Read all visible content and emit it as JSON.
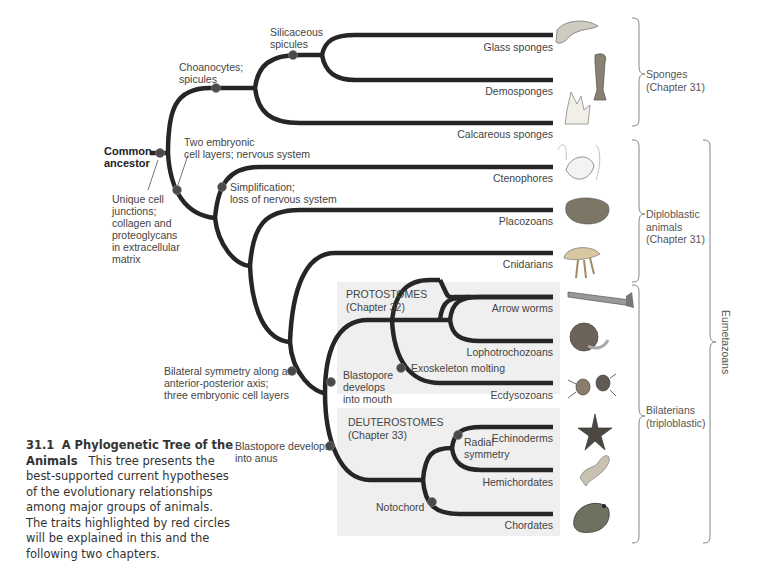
{
  "root": {
    "label_line1": "Common",
    "label_line2": "ancestor"
  },
  "traits": {
    "unique_junctions": [
      "Unique cell",
      "junctions;",
      "collagen and",
      "proteoglycans",
      "in extracellular",
      "matrix"
    ],
    "choanocytes": [
      "Choanocytes;",
      "spicules"
    ],
    "silicaceous": [
      "Silicaceous",
      "spicules"
    ],
    "two_layers": [
      "Two embryonic",
      "cell layers; nervous system"
    ],
    "simplification": [
      "Simplification;",
      "loss of nervous system"
    ],
    "bilateral": [
      "Bilateral symmetry along an",
      "anterior-posterior axis;",
      "three embryonic cell layers"
    ],
    "blastopore_mouth": [
      "Blastopore",
      "develops",
      "into mouth"
    ],
    "exoskeleton": "Exoskeleton molting",
    "blastopore_anus": [
      "Blastopore develops",
      "into anus"
    ],
    "radial": [
      "Radial",
      "symmetry"
    ],
    "notochord": "Notochord"
  },
  "taxa": [
    {
      "name": "Glass sponges",
      "icon": "glass-sponge-illustration"
    },
    {
      "name": "Demosponges",
      "icon": "demosponge-illustration"
    },
    {
      "name": "Calcareous sponges",
      "icon": "calcareous-sponge-illustration"
    },
    {
      "name": "Ctenophores",
      "icon": "ctenophore-illustration"
    },
    {
      "name": "Placozoans",
      "icon": "placozoan-illustration"
    },
    {
      "name": "Cnidarians",
      "icon": "jellyfish-illustration"
    },
    {
      "name": "Arrow worms",
      "icon": "arrow-worm-illustration"
    },
    {
      "name": "Lophotrochozoans",
      "icon": "nautilus-illustration"
    },
    {
      "name": "Ecdysozoans",
      "icon": "mite-illustration"
    },
    {
      "name": "Echinoderms",
      "icon": "sea-star-illustration"
    },
    {
      "name": "Hemichordates",
      "icon": "acorn-worm-illustration"
    },
    {
      "name": "Chordates",
      "icon": "frog-illustration"
    }
  ],
  "panels": {
    "protostomes": {
      "title": "PROTOSTOMES",
      "chapter": "(Chapter 32)"
    },
    "deuterostomes": {
      "title": "DEUTEROSTOMES",
      "chapter": "(Chapter 33)"
    }
  },
  "groups": {
    "sponges": [
      "Sponges",
      "(Chapter 31)"
    ],
    "diploblastic": [
      "Diploblastic",
      "animals",
      "(Chapter 31)"
    ],
    "bilaterians": [
      "Bilaterians",
      "(triploblastic)"
    ],
    "eumetazoans": "Eumetazoans"
  },
  "caption": {
    "number": "31.1",
    "title": "A Phylogenetic Tree of the Animals",
    "body": "This tree presents the best-supported current hypotheses of the evolutionary relationships among major groups of animals. The traits highlighted by red circles will be explained in this and the following two chapters."
  },
  "colors": {
    "branch": "#262626",
    "node": "#4a4a4a",
    "panel": "#f0f0f0",
    "text": "#444444"
  }
}
